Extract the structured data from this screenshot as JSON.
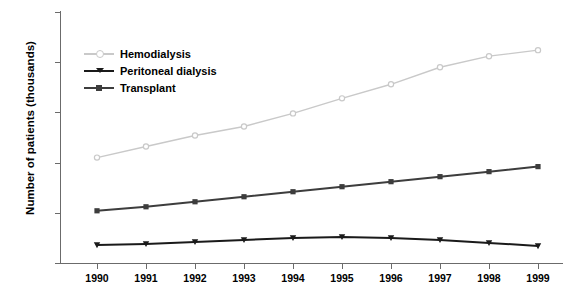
{
  "chart_data": {
    "type": "line",
    "title": "",
    "xlabel": "",
    "ylabel": "Number of patients (thousands)",
    "categories": [
      "1990",
      "1991",
      "1992",
      "1993",
      "1994",
      "1995",
      "1996",
      "1997",
      "1998",
      "1999"
    ],
    "x": [
      1990,
      1991,
      1992,
      1993,
      1994,
      1995,
      1996,
      1997,
      1998,
      1999
    ],
    "ylim": [
      0,
      250
    ],
    "yticks": [
      0,
      50,
      100,
      150,
      200,
      250
    ],
    "xlim": [
      1990,
      1999
    ],
    "grid": false,
    "legend_position": "upper-left-inside",
    "series": [
      {
        "name": "Hemodialysis",
        "color": "#c9c9c9",
        "marker": "circle",
        "values": [
          105,
          116,
          127,
          136,
          149,
          164,
          178,
          195,
          206,
          212
        ]
      },
      {
        "name": "Peritoneal dialysis",
        "color": "#1a1a1a",
        "marker": "triangle-down",
        "values": [
          18,
          19,
          21,
          23,
          25,
          26,
          25,
          23,
          20,
          17
        ]
      },
      {
        "name": "Transplant",
        "color": "#3d3d3d",
        "marker": "square",
        "values": [
          52,
          56,
          61,
          66,
          71,
          76,
          81,
          86,
          91,
          96
        ]
      }
    ]
  },
  "axes": {
    "y_title": "Number of patients (thousands)",
    "y_tick_labels": [
      "250",
      "200",
      "150",
      "100",
      "50",
      "0"
    ],
    "x_tick_labels": [
      "1990",
      "1991",
      "1992",
      "1993",
      "1994",
      "1995",
      "1996",
      "1997",
      "1998",
      "1999"
    ],
    "axis_color": "#6b6b6b"
  },
  "legend": {
    "items": [
      {
        "label": "Hemodialysis",
        "color": "#c9c9c9",
        "marker": "circle"
      },
      {
        "label": "Peritoneal dialysis",
        "color": "#1a1a1a",
        "marker": "triangle-down"
      },
      {
        "label": "Transplant",
        "color": "#3d3d3d",
        "marker": "square"
      }
    ]
  }
}
